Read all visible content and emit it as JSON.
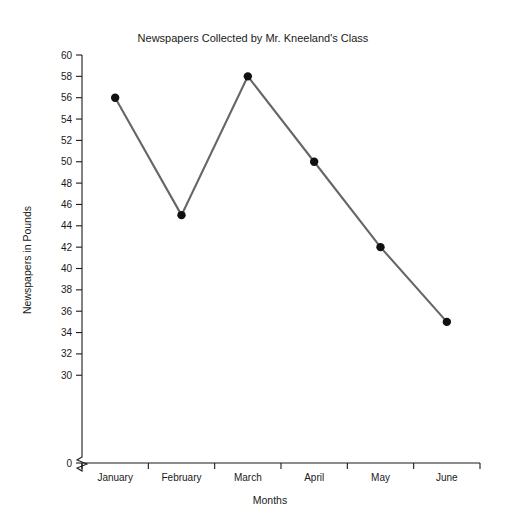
{
  "chart_data": {
    "type": "line",
    "title": "Newspapers Collected by Mr. Kneeland's Class",
    "xlabel": "Months",
    "ylabel": "Newspapers in Pounds",
    "categories": [
      "January",
      "February",
      "March",
      "April",
      "May",
      "June"
    ],
    "values": [
      56,
      45,
      58,
      50,
      42,
      35
    ],
    "series": [
      {
        "name": "Newspapers in Pounds",
        "values": [
          56,
          45,
          58,
          50,
          42,
          35
        ]
      }
    ],
    "ylim": [
      30,
      60
    ],
    "ytick_step": 2,
    "ytick_labels": [
      "60",
      "58",
      "56",
      "54",
      "52",
      "50",
      "48",
      "46",
      "44",
      "42",
      "40",
      "38",
      "36",
      "34",
      "32",
      "30",
      "0"
    ],
    "axis_break": true,
    "axis_break_between": [
      "30",
      "0"
    ],
    "grid": false,
    "legend": "none",
    "line_color": "#666666",
    "marker_color": "#111111",
    "axis_color": "#1a1a1a",
    "background_color": "#ffffff"
  },
  "labels": {
    "title": "Newspapers Collected by Mr. Kneeland's Class",
    "y_axis_title": "Newspapers in Pounds",
    "x_axis_title": "Months"
  }
}
